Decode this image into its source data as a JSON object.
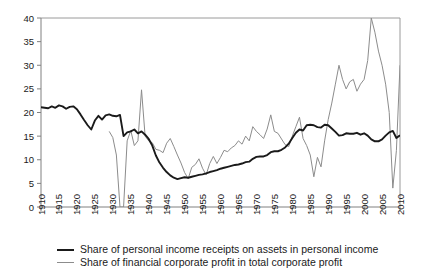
{
  "chart_data": {
    "type": "line",
    "title": "",
    "subtitle": "",
    "xlabel": "",
    "ylabel": "",
    "xlim": [
      1910,
      2010
    ],
    "ylim": [
      0,
      40
    ],
    "xticks": [
      1910,
      1915,
      1920,
      1925,
      1930,
      1935,
      1940,
      1945,
      1950,
      1955,
      1960,
      1965,
      1970,
      1975,
      1980,
      1985,
      1990,
      1995,
      2000,
      2005,
      2010
    ],
    "yticks": [
      0,
      5,
      10,
      15,
      20,
      25,
      30,
      35,
      40
    ],
    "grid": false,
    "legend_position": "below-plot",
    "series": [
      {
        "name": "Share of personal income receipts on assets in personal income",
        "color": "#1a1a1a",
        "width": 1.9,
        "x": [
          1910,
          1911,
          1912,
          1913,
          1914,
          1915,
          1916,
          1917,
          1918,
          1919,
          1920,
          1921,
          1922,
          1923,
          1924,
          1925,
          1926,
          1927,
          1928,
          1929,
          1930,
          1931,
          1932,
          1933,
          1934,
          1935,
          1936,
          1937,
          1938,
          1939,
          1940,
          1941,
          1942,
          1943,
          1944,
          1945,
          1946,
          1947,
          1948,
          1949,
          1950,
          1951,
          1952,
          1953,
          1954,
          1955,
          1956,
          1957,
          1958,
          1959,
          1960,
          1961,
          1962,
          1963,
          1964,
          1965,
          1966,
          1967,
          1968,
          1969,
          1970,
          1971,
          1972,
          1973,
          1974,
          1975,
          1976,
          1977,
          1978,
          1979,
          1980,
          1981,
          1982,
          1983,
          1984,
          1985,
          1986,
          1987,
          1988,
          1989,
          1990,
          1991,
          1992,
          1993,
          1994,
          1995,
          1996,
          1997,
          1998,
          1999,
          2000,
          2001,
          2002,
          2003,
          2004,
          2005,
          2006,
          2007,
          2008,
          2009,
          2010
        ],
        "y": [
          21.1,
          21.0,
          20.9,
          21.3,
          21.0,
          21.5,
          21.3,
          20.8,
          21.2,
          21.3,
          20.7,
          19.6,
          18.4,
          17.3,
          16.4,
          18.3,
          19.3,
          18.5,
          19.4,
          19.6,
          19.3,
          19.2,
          19.5,
          15.0,
          15.8,
          16.0,
          16.4,
          15.6,
          16.0,
          15.3,
          14.4,
          13.0,
          10.9,
          9.4,
          8.3,
          7.4,
          6.7,
          6.2,
          5.9,
          6.1,
          6.3,
          6.2,
          6.4,
          6.6,
          6.8,
          6.9,
          7.1,
          7.4,
          7.6,
          7.8,
          8.1,
          8.3,
          8.5,
          8.7,
          8.9,
          9.0,
          9.2,
          9.5,
          9.6,
          10.2,
          10.6,
          10.7,
          10.7,
          11.0,
          11.6,
          11.8,
          11.8,
          12.1,
          12.6,
          13.4,
          14.6,
          15.7,
          16.4,
          16.2,
          17.3,
          17.4,
          17.3,
          16.9,
          16.8,
          17.4,
          17.3,
          16.6,
          15.9,
          15.1,
          15.2,
          15.6,
          15.5,
          15.5,
          15.7,
          15.3,
          15.6,
          15.1,
          14.3,
          13.9,
          13.9,
          14.3,
          15.1,
          15.8,
          16.1,
          14.6,
          15.2
        ]
      },
      {
        "name": "Share of financial corporate profit in total corporate profit",
        "color": "#8c8c8c",
        "width": 1.0,
        "x": [
          1929,
          1930,
          1931,
          1932,
          1933,
          1934,
          1935,
          1936,
          1937,
          1938,
          1939,
          1940,
          1941,
          1942,
          1943,
          1944,
          1945,
          1946,
          1947,
          1948,
          1949,
          1950,
          1951,
          1952,
          1953,
          1954,
          1955,
          1956,
          1957,
          1958,
          1959,
          1960,
          1961,
          1962,
          1963,
          1964,
          1965,
          1966,
          1967,
          1968,
          1969,
          1970,
          1971,
          1972,
          1973,
          1974,
          1975,
          1976,
          1977,
          1978,
          1979,
          1980,
          1981,
          1982,
          1983,
          1984,
          1985,
          1986,
          1987,
          1988,
          1989,
          1990,
          1991,
          1992,
          1993,
          1994,
          1995,
          1996,
          1997,
          1998,
          1999,
          2000,
          2001,
          2002,
          2003,
          2004,
          2005,
          2006,
          2007,
          2008,
          2009,
          2010
        ],
        "y": [
          16.0,
          14.7,
          11.0,
          0.0,
          0.0,
          14.0,
          16.2,
          13.0,
          14.0,
          24.8,
          15.0,
          14.0,
          13.6,
          12.2,
          12.0,
          11.5,
          13.5,
          14.5,
          12.8,
          11.0,
          9.3,
          7.3,
          6.0,
          8.4,
          9.0,
          10.2,
          8.2,
          6.8,
          9.2,
          10.7,
          9.2,
          10.5,
          12.0,
          11.7,
          12.5,
          13.0,
          14.0,
          13.3,
          15.0,
          14.0,
          17.0,
          16.0,
          15.3,
          14.5,
          16.5,
          19.5,
          16.0,
          15.6,
          14.4,
          13.2,
          12.8,
          15.0,
          17.0,
          19.0,
          14.5,
          13.0,
          11.0,
          6.4,
          10.5,
          8.5,
          14.0,
          18.5,
          22.0,
          26.0,
          30.0,
          27.0,
          25.0,
          26.5,
          27.0,
          24.5,
          26.0,
          27.0,
          31.0,
          40.0,
          37.0,
          33.0,
          30.0,
          26.0,
          20.0,
          4.0,
          12.0,
          30.0
        ]
      }
    ]
  },
  "axis": {
    "y_tick_labels": [
      "0",
      "5",
      "10",
      "15",
      "20",
      "25",
      "30",
      "35",
      "40"
    ],
    "x_tick_labels": [
      "1910",
      "1915",
      "1920",
      "1925",
      "1930",
      "1935",
      "1940",
      "1945",
      "1950",
      "1955",
      "1960",
      "1965",
      "1970",
      "1975",
      "1980",
      "1985",
      "1990",
      "1995",
      "2000",
      "2005",
      "2010"
    ]
  },
  "legend": {
    "items": [
      {
        "label": "Share of personal income receipts on assets in personal income",
        "swatch": "series-black"
      },
      {
        "label": "Share of financial corporate profit in total corporate profit",
        "swatch": "series-gray"
      }
    ]
  },
  "colors": {
    "series_black": "#1a1a1a",
    "series_gray": "#8c8c8c",
    "axis": "#808080",
    "background": "#ffffff"
  }
}
